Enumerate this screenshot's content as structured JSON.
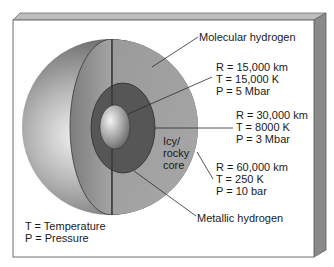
{
  "diagram": {
    "layers": [
      {
        "name": "Molecular hydrogen",
        "label": "Molecular hydrogen"
      },
      {
        "name": "Metallic hydrogen",
        "label": "Metallic hydrogen"
      },
      {
        "name": "Icy/rocky core",
        "label_lines": [
          "Icy/",
          "rocky",
          "core"
        ]
      }
    ],
    "boundaries": [
      {
        "R": "R = 15,000 km",
        "T": "T = 15,000 K",
        "P": "P = 5 Mbar"
      },
      {
        "R": "R = 30,000 km",
        "T": "T = 8000 K",
        "P": "P = 3 Mbar"
      },
      {
        "R": "R = 60,000 km",
        "T": "T = 250 K",
        "P": "P = 10 bar"
      }
    ],
    "legend": {
      "t": "T = Temperature",
      "p": "P = Pressure"
    }
  }
}
